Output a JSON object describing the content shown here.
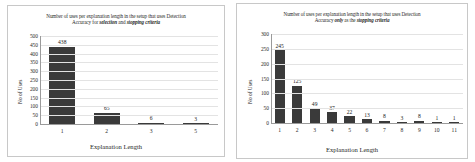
{
  "figure": {
    "background": "#ffffff",
    "bar_color": "#3a3a3a",
    "grid_color": "#e3e3e3",
    "axis_color": "#9a9a9a"
  },
  "chart_data": [
    {
      "type": "bar",
      "panel": "left",
      "title_line1": "Number of uses per explanation length in the setup that uses Detection",
      "title_line2_prefix": "Accuracy for ",
      "title_line2_em1": "selection",
      "title_line2_mid": " and ",
      "title_line2_em2": "stopping criteria",
      "xlabel": "Explanation Length",
      "ylabel": "No of Uses",
      "categories": [
        "1",
        "2",
        "3",
        "5"
      ],
      "values": [
        438,
        65,
        6,
        3
      ],
      "value_labels": [
        "438",
        "65",
        "6",
        "3"
      ],
      "yticks": [
        500,
        450,
        400,
        350,
        300,
        250,
        200,
        150,
        100,
        50,
        0
      ],
      "ytick_labels": [
        "500",
        "450",
        "400",
        "350",
        "300",
        "250",
        "200",
        "150",
        "100",
        "50",
        "0"
      ],
      "ylim": [
        0,
        500
      ],
      "grid": true,
      "legend": "none"
    },
    {
      "type": "bar",
      "panel": "right",
      "title_line1": "Number of uses per explanation length in the setup that uses Detection",
      "title_line2_prefix": "Accuracy ",
      "title_line2_em1": "only",
      "title_line2_mid": " as the ",
      "title_line2_em2": "stopping criteria",
      "xlabel": "Explanation Length",
      "ylabel": "No of Uses",
      "categories": [
        "1",
        "2",
        "3",
        "4",
        "5",
        "6",
        "7",
        "8",
        "9",
        "10",
        "11"
      ],
      "values": [
        245,
        125,
        49,
        37,
        22,
        13,
        8,
        3,
        8,
        1,
        1
      ],
      "value_labels": [
        "245",
        "125",
        "49",
        "37",
        "22",
        "13",
        "8",
        "3",
        "8",
        "1",
        "1"
      ],
      "yticks": [
        300,
        250,
        200,
        150,
        100,
        50,
        0
      ],
      "ytick_labels": [
        "300",
        "250",
        "200",
        "150",
        "100",
        "50",
        "0"
      ],
      "ylim": [
        0,
        300
      ],
      "grid": true,
      "legend": "none"
    }
  ]
}
